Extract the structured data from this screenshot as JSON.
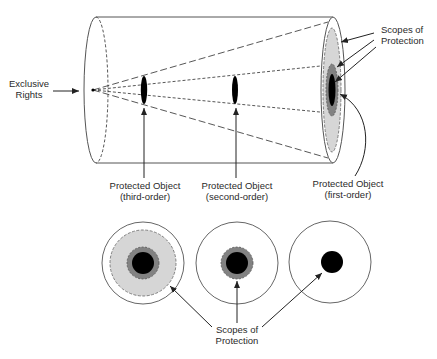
{
  "diagram": {
    "cylinder": {
      "left_label": [
        "Exclusive",
        "Rights"
      ],
      "top_right_label": [
        "Scopes of",
        "Protection"
      ]
    },
    "objects": [
      {
        "label_line1": "Protected Object",
        "label_line2": "(third-order)"
      },
      {
        "label_line1": "Protected Object",
        "label_line2": "(second-order)"
      },
      {
        "label_line1": "Protected Object",
        "label_line2": "(first-order)"
      }
    ],
    "bottom_label": [
      "Scopes of",
      "Protection"
    ],
    "colors": {
      "outline": "#444444",
      "light_gray": "#d4d4d4",
      "mid_gray": "#808080",
      "object": "#000000"
    }
  }
}
